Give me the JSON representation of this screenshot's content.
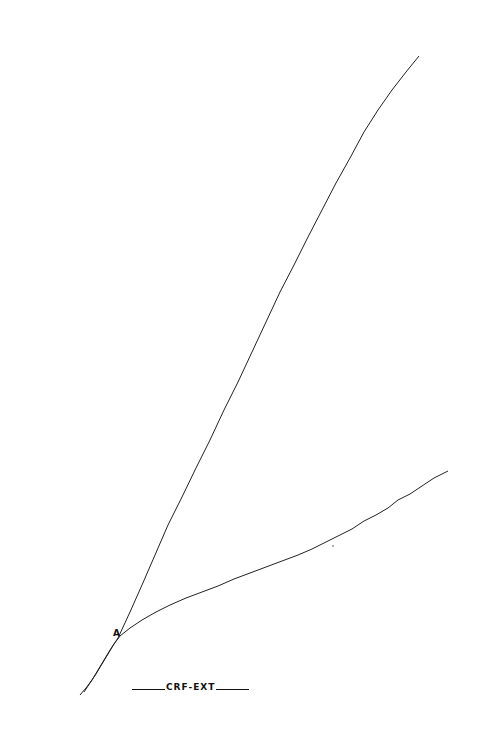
{
  "figure": {
    "point_label": "A",
    "caption": "CRF-EXT",
    "line_color": "#222222",
    "background": "#ffffff"
  },
  "traces": {
    "common": [
      [
        80,
        695
      ],
      [
        86,
        688
      ],
      [
        92,
        680
      ],
      [
        98,
        670
      ],
      [
        104,
        660
      ],
      [
        110,
        650
      ],
      [
        118,
        638
      ]
    ],
    "common_offset": [
      [
        84,
        692
      ],
      [
        90,
        683
      ],
      [
        96,
        674
      ],
      [
        102,
        664
      ],
      [
        108,
        654
      ],
      [
        114,
        644
      ],
      [
        120,
        636
      ]
    ],
    "upper": [
      [
        118,
        638
      ],
      [
        130,
        612
      ],
      [
        142,
        585
      ],
      [
        155,
        555
      ],
      [
        168,
        525
      ],
      [
        182,
        497
      ],
      [
        196,
        468
      ],
      [
        210,
        440
      ],
      [
        224,
        410
      ],
      [
        238,
        382
      ],
      [
        252,
        352
      ],
      [
        266,
        322
      ],
      [
        280,
        292
      ],
      [
        294,
        265
      ],
      [
        308,
        237
      ],
      [
        322,
        210
      ],
      [
        336,
        183
      ],
      [
        350,
        158
      ],
      [
        364,
        132
      ],
      [
        378,
        110
      ],
      [
        392,
        90
      ],
      [
        406,
        72
      ],
      [
        419,
        56
      ]
    ],
    "lower": [
      [
        120,
        636
      ],
      [
        130,
        628
      ],
      [
        142,
        620
      ],
      [
        156,
        612
      ],
      [
        170,
        605
      ],
      [
        186,
        598
      ],
      [
        202,
        592
      ],
      [
        218,
        586
      ],
      [
        234,
        579
      ],
      [
        250,
        573
      ],
      [
        266,
        567
      ],
      [
        282,
        561
      ],
      [
        298,
        555
      ],
      [
        312,
        549
      ],
      [
        326,
        542
      ],
      [
        340,
        535
      ],
      [
        352,
        529
      ],
      [
        364,
        521
      ],
      [
        376,
        515
      ],
      [
        388,
        508
      ],
      [
        398,
        500
      ],
      [
        410,
        494
      ],
      [
        422,
        486
      ],
      [
        434,
        478
      ],
      [
        448,
        471
      ]
    ]
  }
}
